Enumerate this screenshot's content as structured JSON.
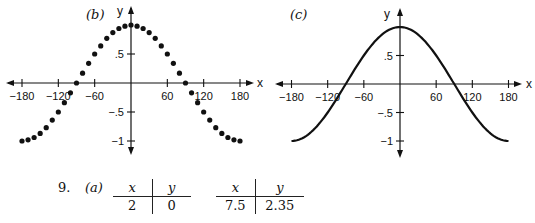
{
  "chart_data": [
    {
      "type": "scatter",
      "panel": "(b)",
      "title": "",
      "xlabel": "x",
      "ylabel": "y",
      "xlim": [
        -180,
        180
      ],
      "ylim": [
        -1,
        1
      ],
      "x_ticks": [
        -180,
        -120,
        -60,
        60,
        120,
        180
      ],
      "y_ticks": [
        ".5",
        "-.5",
        "-1"
      ],
      "series": [
        {
          "name": "y = cos x (points)",
          "x": [
            -180,
            -170,
            -160,
            -150,
            -140,
            -130,
            -120,
            -110,
            -100,
            -90,
            -80,
            -70,
            -60,
            -50,
            -40,
            -30,
            -20,
            -10,
            0,
            10,
            20,
            30,
            40,
            50,
            60,
            70,
            80,
            90,
            100,
            110,
            120,
            130,
            140,
            150,
            160,
            170,
            180
          ],
          "values": [
            -1,
            -0.98,
            -0.94,
            -0.87,
            -0.77,
            -0.64,
            -0.5,
            -0.34,
            -0.17,
            0,
            0.17,
            0.34,
            0.5,
            0.64,
            0.77,
            0.87,
            0.94,
            0.98,
            1,
            0.98,
            0.94,
            0.87,
            0.77,
            0.64,
            0.5,
            0.34,
            0.17,
            0,
            -0.17,
            -0.34,
            -0.5,
            -0.64,
            -0.77,
            -0.87,
            -0.94,
            -0.98,
            -1
          ]
        }
      ],
      "grid": false
    },
    {
      "type": "line",
      "panel": "(c)",
      "title": "",
      "xlabel": "x",
      "ylabel": "y",
      "xlim": [
        -180,
        180
      ],
      "ylim": [
        -1,
        1
      ],
      "x_ticks": [
        -180,
        -120,
        -60,
        60,
        120,
        180
      ],
      "y_ticks": [
        ".5",
        "-.5",
        "-1"
      ],
      "series": [
        {
          "name": "y = cos x (curve)",
          "x": [
            -180,
            -150,
            -120,
            -90,
            -60,
            -30,
            0,
            30,
            60,
            90,
            120,
            150,
            180
          ],
          "values": [
            -1,
            -0.87,
            -0.5,
            0,
            0.5,
            0.87,
            1,
            0.87,
            0.5,
            0,
            -0.5,
            -0.87,
            -1
          ]
        }
      ],
      "grid": false
    }
  ],
  "panels": {
    "b": {
      "label": "(b)",
      "x_axis_name": "x",
      "y_axis_name": "y",
      "x_tick_labels": [
        "−180",
        "−120",
        "−60",
        "60",
        "120",
        "180"
      ],
      "y_tick_labels": [
        ".5",
        "−.5",
        "−1"
      ]
    },
    "c": {
      "label": "(c)",
      "x_axis_name": "x",
      "y_axis_name": "y",
      "x_tick_labels": [
        "−180",
        "−120",
        "−60",
        "60",
        "120",
        "180"
      ],
      "y_tick_labels": [
        ".5",
        "−.5",
        "−1"
      ]
    }
  },
  "problem": {
    "number": "9.",
    "part": "(a)",
    "tables": [
      {
        "headers": [
          "x",
          "y"
        ],
        "rows": [
          [
            "2",
            "0"
          ]
        ]
      },
      {
        "headers": [
          "x",
          "y"
        ],
        "rows": [
          [
            "7.5",
            "2.35"
          ]
        ]
      }
    ]
  }
}
